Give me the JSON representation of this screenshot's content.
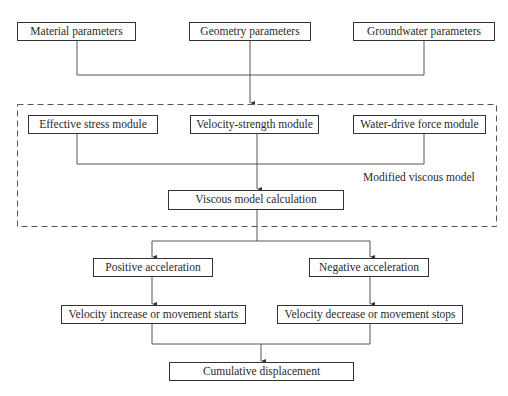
{
  "inputs": {
    "material": "Material parameters",
    "geometry": "Geometry parameters",
    "groundwater": "Groundwater parameters"
  },
  "model": {
    "group_label": "Modified viscous model",
    "modules": {
      "effective_stress": "Effective stress module",
      "velocity_strength": "Velocity-strength module",
      "water_drive": "Water-drive force module"
    },
    "calculation": "Viscous model calculation"
  },
  "branches": {
    "positive": {
      "label": "Positive acceleration",
      "result": "Velocity increase or movement starts"
    },
    "negative": {
      "label": "Negative acceleration",
      "result": "Velocity decrease or movement stops"
    }
  },
  "output": {
    "label": "Cumulative displacement"
  },
  "colors": {
    "line": "#555555",
    "border": "#333333"
  }
}
